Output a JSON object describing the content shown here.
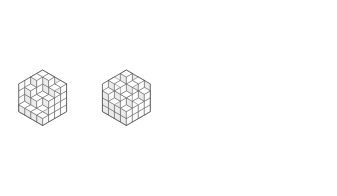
{
  "figure": {
    "type": "rhombille-tiling-pair",
    "background_color": "#ffffff",
    "stroke_color": "#4a4a4a",
    "outline_color": "#3c3c3c",
    "face_colors": {
      "top": "#ffffff",
      "left": "#ebebeb",
      "right": "#fdfdfd"
    },
    "canvas": {
      "width": 337,
      "height": 196
    }
  },
  "panels": [
    {
      "name": "left-hexagon",
      "label": "Left hexagon tiling",
      "order": 4,
      "center_x": 85.5,
      "center_y": 97.5,
      "cell_width": 24.0,
      "cell_height": 13.9,
      "height_map": [
        [
          4,
          4,
          3,
          4
        ],
        [
          4,
          2,
          2,
          3
        ],
        [
          3,
          2,
          1,
          3
        ],
        [
          1,
          1,
          1,
          1
        ]
      ]
    },
    {
      "name": "right-hexagon",
      "label": "Right hexagon tiling",
      "order": 4,
      "center_x": 253.5,
      "center_y": 97.5,
      "cell_width": 24.0,
      "cell_height": 13.9,
      "height_map": [
        [
          4,
          3,
          4,
          3
        ],
        [
          3,
          2,
          3,
          2
        ],
        [
          4,
          3,
          4,
          3
        ],
        [
          3,
          2,
          3,
          2
        ]
      ]
    }
  ],
  "chart_data": {
    "type": "table",
    "xlabel": "column index (a)",
    "ylabel": "row index (b)",
    "legend": [
      "top face",
      "left face",
      "right face"
    ],
    "series": [
      {
        "name": "left-hexagon",
        "values": [
          4,
          4,
          3,
          4,
          4,
          2,
          2,
          3,
          3,
          2,
          1,
          3,
          1,
          1,
          1,
          1
        ]
      },
      {
        "name": "right-hexagon",
        "values": [
          4,
          3,
          4,
          3,
          3,
          2,
          3,
          2,
          4,
          3,
          4,
          3,
          3,
          2,
          3,
          2
        ]
      }
    ],
    "categories": [
      "r0c0",
      "r0c1",
      "r0c2",
      "r0c3",
      "r1c0",
      "r1c1",
      "r1c2",
      "r1c3",
      "r2c0",
      "r2c1",
      "r2c2",
      "r2c3",
      "r3c0",
      "r3c1",
      "r3c2",
      "r3c3"
    ],
    "ylim": [
      0,
      4
    ],
    "grid": false
  }
}
